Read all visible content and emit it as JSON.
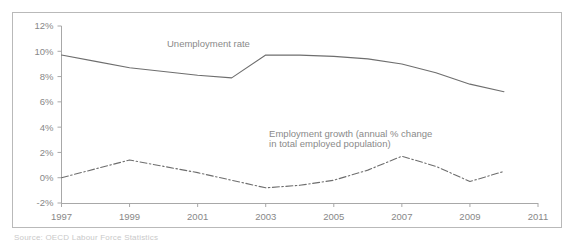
{
  "chart_data": {
    "type": "line",
    "title": "",
    "subtitle": "",
    "xlabel": "",
    "ylabel": "",
    "xlim": [
      1997,
      2011
    ],
    "ylim": [
      -2,
      12
    ],
    "grid": false,
    "legend_position": "inline-annotations",
    "x_ticks": [
      "1997",
      "1999",
      "2001",
      "2003",
      "2005",
      "2007",
      "2009",
      "2011"
    ],
    "x_tick_values": [
      1997,
      1999,
      2001,
      2003,
      2005,
      2007,
      2009,
      2011
    ],
    "y_ticks": [
      "-2%",
      "0%",
      "2%",
      "4%",
      "6%",
      "8%",
      "10%",
      "12%"
    ],
    "y_tick_values": [
      -2,
      0,
      2,
      4,
      6,
      8,
      10,
      12
    ],
    "x": [
      1997,
      1998,
      1999,
      2000,
      2001,
      2002,
      2003,
      2004,
      2005,
      2006,
      2007,
      2008,
      2009,
      2010
    ],
    "series": [
      {
        "name": "Unemployment rate",
        "style": "solid",
        "color": "#6e6e6e",
        "values": [
          9.7,
          9.2,
          8.7,
          8.4,
          8.1,
          7.9,
          9.7,
          9.7,
          9.6,
          9.4,
          9.0,
          8.3,
          7.4,
          6.8
        ]
      },
      {
        "name": "Employment growth (annual % change in total employed population)",
        "label_line1": "Employment growth (annual % change",
        "label_line2": "in total employed population)",
        "style": "dash-dot",
        "color": "#6e6e6e",
        "values": [
          0.0,
          0.7,
          1.4,
          0.9,
          0.4,
          -0.2,
          -0.8,
          -0.6,
          -0.2,
          0.6,
          1.7,
          0.9,
          -0.3,
          0.5
        ]
      }
    ],
    "annotations": [
      {
        "text": "Unemployment rate",
        "x": 2000.1,
        "y": 10.35
      },
      {
        "text": "Employment growth (annual % change",
        "x": 2003.1,
        "y": 3.25
      },
      {
        "text": "in total employed population)",
        "x": 2003.1,
        "y": 2.45
      }
    ]
  },
  "footnote": {
    "text": "Source: OECD Labour Force Statistics"
  }
}
